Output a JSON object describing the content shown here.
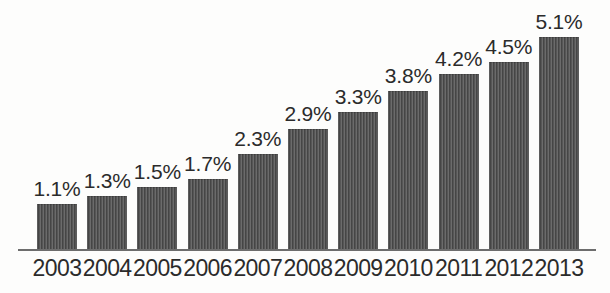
{
  "chart_data": {
    "type": "bar",
    "title": "",
    "subtitle": "",
    "xlabel": "",
    "ylabel": "",
    "grid": false,
    "legend": "none",
    "ylim": [
      0,
      5.1
    ],
    "categories": [
      "2003",
      "2004",
      "2005",
      "2006",
      "2007",
      "2008",
      "2009",
      "2010",
      "2011",
      "2012",
      "2013"
    ],
    "values": [
      1.1,
      1.3,
      1.5,
      1.7,
      2.3,
      2.9,
      3.3,
      3.8,
      4.2,
      4.5,
      5.1
    ],
    "value_labels": [
      "1.1%",
      "1.3%",
      "1.5%",
      "1.7%",
      "2.3%",
      "2.9%",
      "3.3%",
      "3.8%",
      "4.2%",
      "4.5%",
      "5.1%"
    ],
    "bar_color": "#4d4d4d",
    "axis_color": "#6d6d6d",
    "label_color": "#2b2b2b",
    "background_color": "#fdfdfc"
  }
}
